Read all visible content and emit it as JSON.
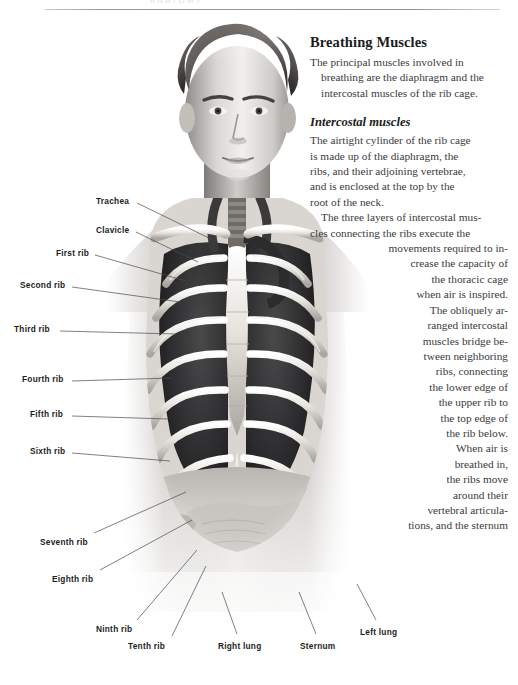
{
  "page": {
    "header_ghost": "ANATOMY",
    "background": "#ffffff",
    "text_color": "#3a3a3c"
  },
  "article": {
    "title": "Breathing Muscles",
    "intro_lines": [
      "The principal muscles involved in",
      "breathing are the diaphragm and the",
      "intercostal muscles of the rib cage."
    ],
    "subtitle": "Intercostal muscles",
    "body_lines_left": [
      "The airtight cylinder of the rib cage",
      "is made up of the diaphragm, the",
      "ribs, and their adjoining vertebrae,",
      "and is enclosed at the top by the",
      "root of the neck."
    ],
    "body_lines_right": [
      "The three layers of intercostal mus-",
      "cles connecting the ribs execute the",
      "movements required to in-",
      "crease the capacity of",
      "the thoracic cage",
      "when air is inspired.",
      "The obliquely ar-",
      "ranged intercostal",
      "muscles bridge be-",
      "tween neighboring",
      "ribs, connecting",
      "the lower edge of",
      "the upper rib to",
      "the top edge of",
      "the rib below.",
      "When air is",
      "breathed in,",
      "the ribs move",
      "around their",
      "vertebral articula-",
      "tions, and the sternum"
    ]
  },
  "labels": [
    {
      "name": "trachea",
      "text": "Trachea",
      "x": 96,
      "y": 196,
      "lx": 137,
      "ly": 203,
      "tx": 213,
      "ty": 240
    },
    {
      "name": "clavicle",
      "text": "Clavicle",
      "x": 96,
      "y": 225,
      "lx": 136,
      "ly": 232,
      "tx": 198,
      "ty": 262
    },
    {
      "name": "first-rib",
      "text": "First rib",
      "x": 56,
      "y": 248,
      "lx": 95,
      "ly": 255,
      "tx": 186,
      "ty": 281
    },
    {
      "name": "second-rib",
      "text": "Second rib",
      "x": 20,
      "y": 280,
      "lx": 72,
      "ly": 287,
      "tx": 180,
      "ty": 302
    },
    {
      "name": "third-rib",
      "text": "Third rib",
      "x": 14,
      "y": 324,
      "lx": 60,
      "ly": 331,
      "tx": 176,
      "ty": 334
    },
    {
      "name": "fourth-rib",
      "text": "Fourth rib",
      "x": 22,
      "y": 374,
      "lx": 72,
      "ly": 381,
      "tx": 172,
      "ty": 378
    },
    {
      "name": "fifth-rib",
      "text": "Fifth rib",
      "x": 30,
      "y": 409,
      "lx": 72,
      "ly": 416,
      "tx": 168,
      "ty": 419
    },
    {
      "name": "sixth-rib",
      "text": "Sixth rib",
      "x": 30,
      "y": 446,
      "lx": 72,
      "ly": 453,
      "tx": 170,
      "ty": 461
    },
    {
      "name": "seventh-rib",
      "text": "Seventh rib",
      "x": 40,
      "y": 537,
      "lx": 94,
      "ly": 533,
      "tx": 186,
      "ty": 492
    },
    {
      "name": "eighth-rib",
      "text": "Eighth rib",
      "x": 52,
      "y": 574,
      "lx": 100,
      "ly": 570,
      "tx": 192,
      "ty": 520
    },
    {
      "name": "ninth-rib",
      "text": "Ninth rib",
      "x": 96,
      "y": 624,
      "lx": 137,
      "ly": 620,
      "tx": 197,
      "ty": 550
    },
    {
      "name": "tenth-rib",
      "text": "Tenth rib",
      "x": 128,
      "y": 641,
      "lx": 172,
      "ly": 636,
      "tx": 206,
      "ty": 566
    },
    {
      "name": "right-lung",
      "text": "Right lung",
      "x": 218,
      "y": 641,
      "lx": 237,
      "ly": 634,
      "tx": 222,
      "ty": 592
    },
    {
      "name": "sternum",
      "text": "Sternum",
      "x": 300,
      "y": 641,
      "lx": 316,
      "ly": 634,
      "tx": 299,
      "ty": 592
    },
    {
      "name": "left-lung",
      "text": "Left lung",
      "x": 360,
      "y": 627,
      "lx": 376,
      "ly": 620,
      "tx": 357,
      "ty": 584
    }
  ],
  "illustration": {
    "name": "male-torso-thorax-anatomy",
    "description": "Grayscale airbrush illustration of a male head and thorax with rib cage, lungs and sternum exposed"
  }
}
